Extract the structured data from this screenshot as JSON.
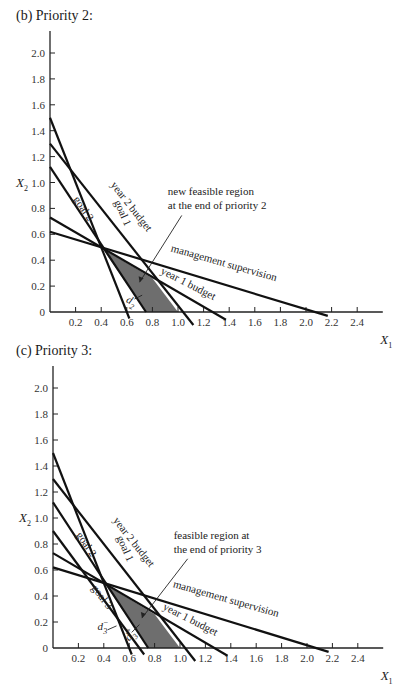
{
  "panels": [
    {
      "id": "b",
      "title": "(b)  Priority 2:",
      "annotation": [
        "new feasible region",
        "at the end of priority 2"
      ],
      "deviation_label": "d",
      "deviation_sub": "2",
      "deviation_sup": "−"
    },
    {
      "id": "c",
      "title": "(c)  Priority 3:",
      "annotation": [
        "feasible region at",
        "the end of priority 3"
      ],
      "deviation_label": "d",
      "deviation_sub": "3",
      "deviation_sup": "−",
      "deviation_label_2": "d",
      "deviation_sub_2": "3",
      "deviation_sup_2": "+"
    }
  ],
  "axes": {
    "x_label": "X",
    "x_sub": "1",
    "y_label": "X",
    "y_sub": "2",
    "x_ticks": [
      "0.2",
      "0.4",
      "0.6",
      "0.8",
      "1.0",
      "1.2",
      "1.4",
      "1.6",
      "1.8",
      "2.0",
      "2.2",
      "2.4"
    ],
    "y_ticks": [
      "0",
      "0.2",
      "0.4",
      "0.6",
      "0.8",
      "1.0",
      "1.2",
      "1.4",
      "1.6",
      "1.8",
      "2.0"
    ]
  },
  "line_labels": {
    "year2": "year 2 budget",
    "goal1": "goal 1",
    "goal2": "goal 2",
    "goal3": "goal 3",
    "year1": "year 1 budget",
    "mgmt": "management supervision"
  },
  "chart_data": [
    {
      "type": "line",
      "title": "(b) Priority 2",
      "xlabel": "X1",
      "ylabel": "X2",
      "xlim": [
        0,
        2.5
      ],
      "ylim": [
        0,
        2.1
      ],
      "series": [
        {
          "name": "goal 1",
          "points": [
            [
              0,
              1.5
            ],
            [
              0.6,
              0
            ]
          ]
        },
        {
          "name": "year 2 budget",
          "points": [
            [
              0,
              1.3
            ],
            [
              1.04,
              0
            ]
          ]
        },
        {
          "name": "goal 2",
          "points": [
            [
              0,
              1.12
            ],
            [
              0.75,
              0
            ]
          ]
        },
        {
          "name": "year 1 budget",
          "points": [
            [
              0,
              0.73
            ],
            [
              1.27,
              0
            ]
          ]
        },
        {
          "name": "management supervision",
          "points": [
            [
              0,
              0.62
            ],
            [
              2.07,
              0
            ]
          ]
        }
      ],
      "shaded_region": [
        [
          0.41,
          0.49
        ],
        [
          0.8,
          0.26
        ],
        [
          1.0,
          0
        ],
        [
          0.75,
          0
        ]
      ],
      "annotations": [
        "new feasible region at the end of priority 2",
        "d2-"
      ]
    },
    {
      "type": "line",
      "title": "(c) Priority 3",
      "xlabel": "X1",
      "ylabel": "X2",
      "xlim": [
        0,
        2.5
      ],
      "ylim": [
        0,
        2.1
      ],
      "series": [
        {
          "name": "goal 1",
          "points": [
            [
              0,
              1.5
            ],
            [
              0.6,
              0
            ]
          ]
        },
        {
          "name": "year 2 budget",
          "points": [
            [
              0,
              1.3
            ],
            [
              1.04,
              0
            ]
          ]
        },
        {
          "name": "goal 2",
          "points": [
            [
              0,
              1.12
            ],
            [
              0.75,
              0
            ]
          ]
        },
        {
          "name": "goal 3",
          "points": [
            [
              0,
              0.9
            ],
            [
              0.68,
              0
            ]
          ]
        },
        {
          "name": "year 1 budget",
          "points": [
            [
              0,
              0.73
            ],
            [
              1.27,
              0
            ]
          ]
        },
        {
          "name": "management supervision",
          "points": [
            [
              0,
              0.62
            ],
            [
              2.07,
              0
            ]
          ]
        }
      ],
      "shaded_region": [
        [
          0.41,
          0.49
        ],
        [
          0.8,
          0.26
        ],
        [
          1.0,
          0
        ],
        [
          0.75,
          0
        ]
      ],
      "annotations": [
        "feasible region at the end of priority 3",
        "d3-",
        "d3+"
      ]
    }
  ]
}
